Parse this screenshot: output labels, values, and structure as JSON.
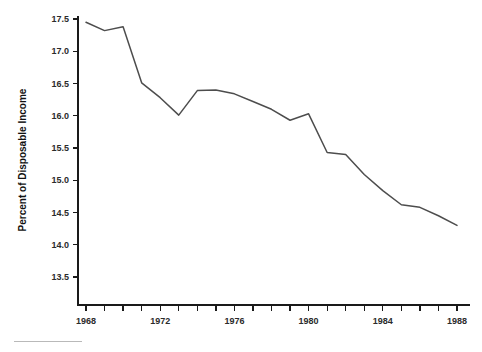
{
  "chart_data": {
    "type": "line",
    "title": "",
    "subtitle": "",
    "xlabel": "",
    "ylabel": "Percent of Disposable Income",
    "xlim": [
      1968,
      1988
    ],
    "ylim": [
      13.5,
      17.5
    ],
    "grid": false,
    "legend": false,
    "legend_position": "none",
    "line_color": "#4d4d4d",
    "axis_color": "#1a1a1a",
    "x_tick_interval": 1,
    "x_label_interval": 4,
    "y_tick_interval": 0.5,
    "x_tick_labels": [
      "1968",
      "1972",
      "1976",
      "1980",
      "1984",
      "1988"
    ],
    "x_tick_label_values": [
      1968,
      1972,
      1976,
      1980,
      1984,
      1988
    ],
    "y_tick_labels": [
      "13.5",
      "14.0",
      "14.5",
      "15.0",
      "15.5",
      "16.0",
      "16.5",
      "17.0",
      "17.5"
    ],
    "y_tick_values": [
      13.5,
      14.0,
      14.5,
      15.0,
      15.5,
      16.0,
      16.5,
      17.0,
      17.5
    ],
    "x_all_ticks": [
      1968,
      1969,
      1970,
      1971,
      1972,
      1973,
      1974,
      1975,
      1976,
      1977,
      1978,
      1979,
      1980,
      1981,
      1982,
      1983,
      1984,
      1985,
      1986,
      1987,
      1988
    ],
    "series": [
      {
        "name": "Percent of Disposable Income",
        "x": [
          1968,
          1969,
          1970,
          1971,
          1972,
          1973,
          1974,
          1975,
          1976,
          1977,
          1978,
          1979,
          1980,
          1981,
          1982,
          1983,
          1984,
          1985,
          1986,
          1987,
          1988
        ],
        "values": [
          17.45,
          17.32,
          17.38,
          16.51,
          16.28,
          16.01,
          16.39,
          16.4,
          16.34,
          16.22,
          16.1,
          15.93,
          16.03,
          15.43,
          15.4,
          15.09,
          14.84,
          14.62,
          14.58,
          14.45,
          14.3
        ]
      }
    ]
  },
  "footer": {
    "rule_present": true
  }
}
